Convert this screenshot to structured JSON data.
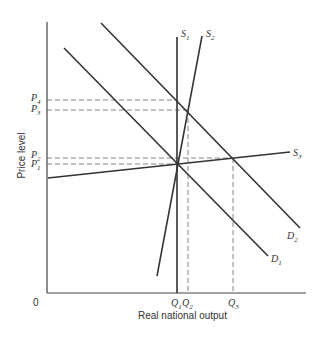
{
  "diagram": {
    "type": "aggregate supply and demand",
    "xlabel": "Real national output",
    "ylabel": "Price level",
    "origin": "0",
    "curves": [
      {
        "name": "S",
        "sub": "1",
        "x1": 177,
        "y1": 18,
        "x2": 177,
        "y2": 293
      },
      {
        "name": "S",
        "sub": "2",
        "x1": 202,
        "y1": 18,
        "x2": 157,
        "y2": 276
      },
      {
        "name": "S",
        "sub": "3",
        "x1": 48,
        "y1": 178,
        "x2": 290,
        "y2": 152
      },
      {
        "name": "D",
        "sub": "1",
        "x1": 64,
        "y1": 48,
        "x2": 268,
        "y2": 256
      },
      {
        "name": "D",
        "sub": "2",
        "x1": 101,
        "y1": 23,
        "x2": 300,
        "y2": 228
      }
    ],
    "price_levels": [
      {
        "label": "P",
        "sub": "4",
        "y": 100
      },
      {
        "label": "P",
        "sub": "3",
        "y": 110
      },
      {
        "label": "P",
        "sub": "2",
        "y": 158
      },
      {
        "label": "P",
        "sub": "1",
        "y": 164
      }
    ],
    "quantities": [
      {
        "label": "Q",
        "sub": "1",
        "x": 177
      },
      {
        "label": "Q",
        "sub": "2",
        "x": 188
      },
      {
        "label": "Q",
        "sub": "3",
        "x": 233
      }
    ]
  }
}
